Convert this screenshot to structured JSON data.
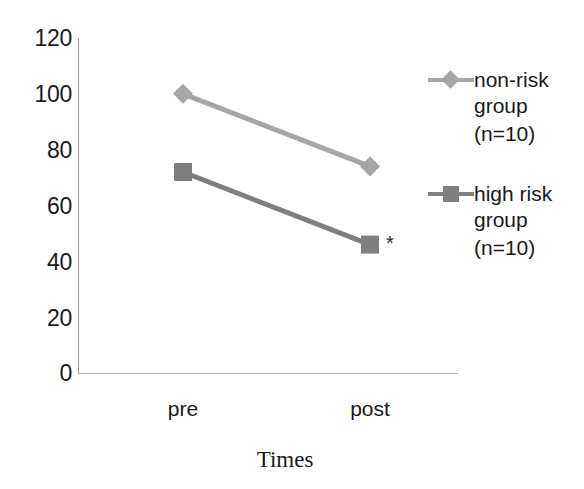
{
  "chart_data": {
    "type": "line",
    "title": "",
    "xlabel": "Times",
    "ylabel": "",
    "categories": [
      "pre",
      "post"
    ],
    "x": [
      "pre",
      "post"
    ],
    "ylim": [
      0,
      120
    ],
    "yticks": [
      120,
      100,
      80,
      60,
      40,
      20,
      0
    ],
    "ytick_labels": [
      "120",
      "100",
      "80",
      "60",
      "40",
      "20",
      "0"
    ],
    "grid": false,
    "legend_position": "right",
    "series": [
      {
        "name": "non-risk group (n=10)",
        "name_line1": "non-risk",
        "name_line2": "group",
        "name_line3": "(n=10)",
        "marker": "diamond",
        "color": "#a6a6a6",
        "values": [
          100,
          74
        ]
      },
      {
        "name": "high risk group (n=10)",
        "name_line1": "high risk",
        "name_line2": "group",
        "name_line3": "(n=10)",
        "marker": "square",
        "color": "#7f7f7f",
        "values": [
          72,
          46
        ]
      }
    ],
    "annotations": [
      {
        "text": "*",
        "near_series": "high risk group (n=10)",
        "near_point": "post",
        "meaning": "significance-marker"
      }
    ]
  },
  "axis": {
    "y_labels": [
      "120",
      "100",
      "80",
      "60",
      "40",
      "20",
      "0"
    ],
    "x_labels": [
      "pre",
      "post"
    ],
    "x_title": "Times",
    "axis_color": "#9a9a9a"
  },
  "legend": {
    "entries": [
      {
        "line1": "non-risk",
        "line2": "group",
        "line3": "(n=10)",
        "marker": "diamond-marker",
        "color": "#a6a6a6"
      },
      {
        "line1": "high risk",
        "line2": "group",
        "line3": "(n=10)",
        "marker": "square-marker",
        "color": "#7f7f7f"
      }
    ]
  },
  "annotation": {
    "asterisk": "*"
  },
  "colors": {
    "non_risk_series": "#a6a6a6",
    "high_risk_series": "#7f7f7f",
    "axis": "#9a9a9a",
    "text": "#1a1a1a",
    "background": "#ffffff"
  }
}
